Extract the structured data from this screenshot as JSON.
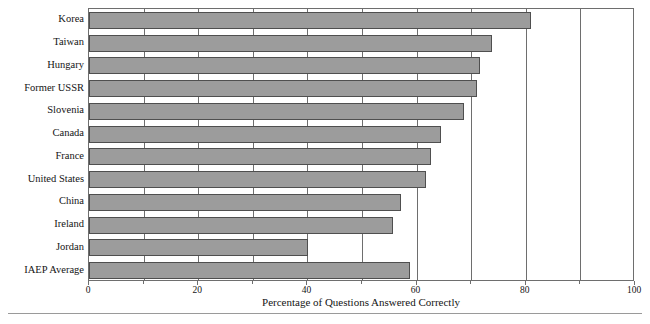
{
  "chart_data": {
    "type": "bar",
    "orientation": "horizontal",
    "title": "",
    "xlabel": "Percentage of Questions Answered Correctly",
    "ylabel": "",
    "xlim": [
      0,
      100
    ],
    "xticks": [
      0,
      20,
      40,
      60,
      80,
      100
    ],
    "xtick_labels": [
      "0",
      "20",
      "40",
      "60",
      "80",
      "100"
    ],
    "minor_tick_interval": 10,
    "grid": true,
    "grid_axis": "x",
    "legend": false,
    "bar_color": "#9c9c9c",
    "bar_edge_color": "#4f4f4f",
    "axis_color": "#6e6e6e",
    "categories": [
      "Korea",
      "Taiwan",
      "Hungary",
      "Former USSR",
      "Slovenia",
      "Canada",
      "France",
      "United States",
      "China",
      "Ireland",
      "Jordan",
      "IAEP Average"
    ],
    "values": [
      80.9,
      73.8,
      71.6,
      71.0,
      68.6,
      64.4,
      62.7,
      61.7,
      57.2,
      55.6,
      40.1,
      58.7
    ]
  },
  "footer": {
    "caption": ""
  }
}
